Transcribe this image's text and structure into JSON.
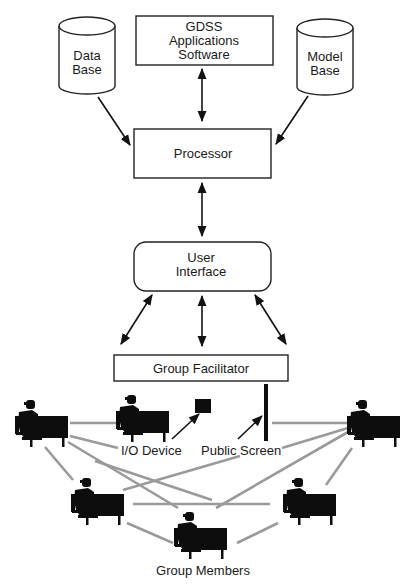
{
  "diagram": {
    "type": "GDSS architecture",
    "nodes": {
      "data_base": {
        "line1": "Data",
        "line2": "Base",
        "shape": "cylinder"
      },
      "gdss_software": {
        "line1": "GDSS",
        "line2": "Applications",
        "line3": "Software",
        "shape": "rectangle"
      },
      "model_base": {
        "line1": "Model",
        "line2": "Base",
        "shape": "cylinder"
      },
      "processor": {
        "label": "Processor",
        "shape": "rectangle"
      },
      "user_interface": {
        "line1": "User",
        "line2": "Interface",
        "shape": "rounded-rectangle"
      },
      "group_facilitator": {
        "label": "Group Facilitator",
        "shape": "rectangle"
      }
    },
    "annotations": {
      "io_device": "I/O Device",
      "public_screen": "Public Screen",
      "group_members": "Group Members"
    },
    "edges": [
      {
        "from": "data_base",
        "to": "processor",
        "direction": "one-way"
      },
      {
        "from": "model_base",
        "to": "processor",
        "direction": "one-way"
      },
      {
        "from": "gdss_software",
        "to": "processor",
        "direction": "two-way"
      },
      {
        "from": "processor",
        "to": "user_interface",
        "direction": "two-way"
      },
      {
        "from": "user_interface",
        "to": "group_members_left",
        "direction": "two-way"
      },
      {
        "from": "user_interface",
        "to": "group_facilitator",
        "direction": "two-way"
      },
      {
        "from": "user_interface",
        "to": "group_members_right",
        "direction": "two-way"
      }
    ],
    "group_member_count": 6,
    "colors": {
      "line": "#111111",
      "network_link": "#9a9a9a",
      "silhouette": "#0d0d0d",
      "background": "#ffffff"
    }
  }
}
